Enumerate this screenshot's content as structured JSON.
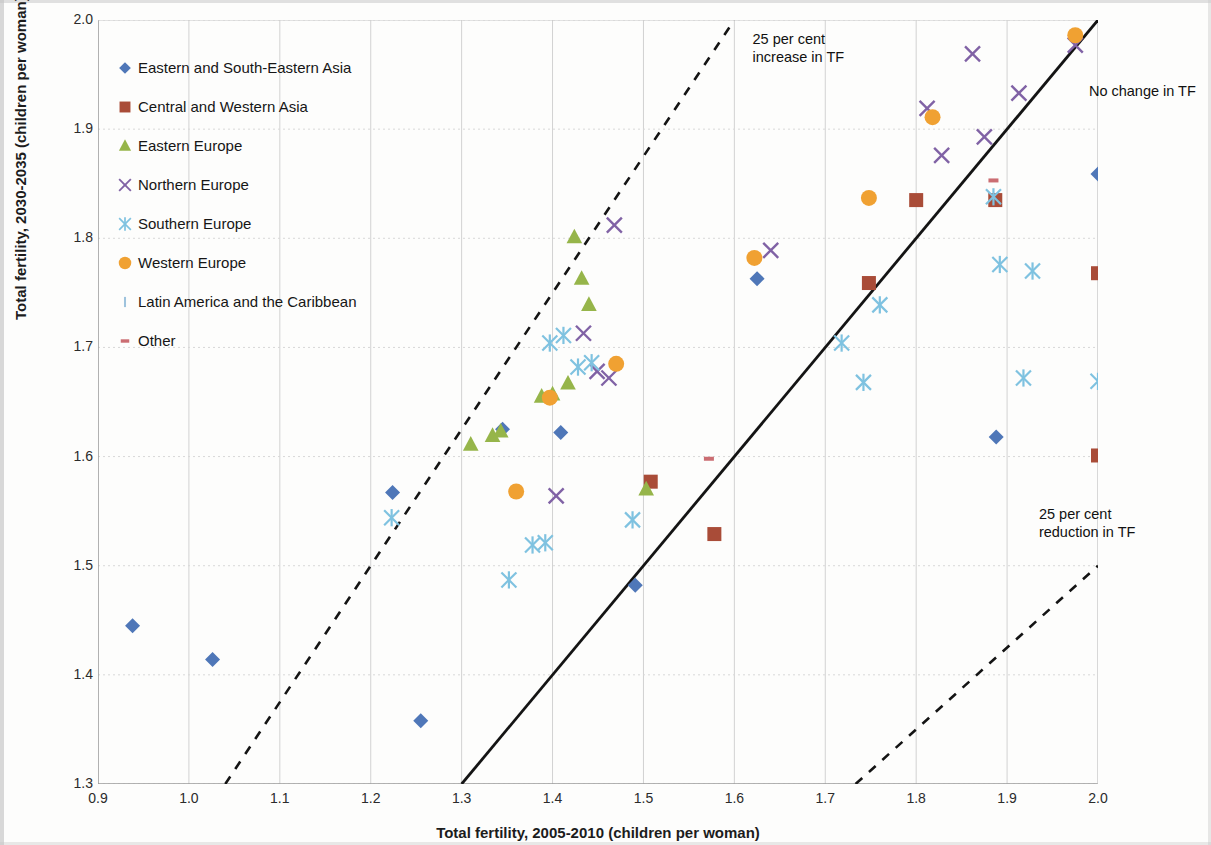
{
  "chart_data": {
    "type": "scatter",
    "title": "",
    "xlabel": "Total fertility, 2005-2010 (children per woman)",
    "ylabel": "Total fertility, 2030-2035 (children per woman)",
    "xlim": [
      0.9,
      2.0
    ],
    "ylim": [
      1.3,
      2.0
    ],
    "xticks": [
      "0.9",
      "1.0",
      "1.1",
      "1.2",
      "1.3",
      "1.4",
      "1.5",
      "1.6",
      "1.7",
      "1.8",
      "1.9",
      "2.0"
    ],
    "yticks": [
      "1.3",
      "1.4",
      "1.5",
      "1.6",
      "1.7",
      "1.8",
      "1.9",
      "2.0"
    ],
    "grid": true,
    "legend_position": "upper-left-inside",
    "reference_lines": [
      {
        "name": "no-change",
        "label": "No change in TF",
        "style": "solid",
        "slope": 1.0,
        "intercept": 0.0
      },
      {
        "name": "increase-25",
        "label": "25 per cent increase in TF",
        "style": "dashed",
        "slope": 1.25,
        "intercept": 0.0
      },
      {
        "name": "reduction-25",
        "label": "25 per cent reduction in TF",
        "style": "dashed",
        "slope": 0.75,
        "intercept": 0.0
      }
    ],
    "series": [
      {
        "name": "Eastern and South-Eastern Asia",
        "marker": "diamond",
        "color": "#4f77b8",
        "points": [
          [
            0.938,
            1.445
          ],
          [
            1.026,
            1.414
          ],
          [
            1.224,
            1.567
          ],
          [
            1.255,
            1.358
          ],
          [
            1.345,
            1.625
          ],
          [
            1.409,
            1.622
          ],
          [
            1.491,
            1.482
          ],
          [
            1.625,
            1.763
          ],
          [
            1.888,
            1.618
          ],
          [
            2.0,
            1.859
          ]
        ]
      },
      {
        "name": "Central and Western Asia",
        "marker": "square",
        "color": "#a94c38",
        "points": [
          [
            1.508,
            1.577
          ],
          [
            1.578,
            1.529
          ],
          [
            1.748,
            1.759
          ],
          [
            1.8,
            1.835
          ],
          [
            1.887,
            1.835
          ],
          [
            2.0,
            1.768
          ],
          [
            2.0,
            1.601
          ]
        ]
      },
      {
        "name": "Eastern Europe",
        "marker": "triangle",
        "color": "#96b54a",
        "points": [
          [
            1.31,
            1.611
          ],
          [
            1.334,
            1.619
          ],
          [
            1.343,
            1.623
          ],
          [
            1.388,
            1.655
          ],
          [
            1.4,
            1.657
          ],
          [
            1.417,
            1.667
          ],
          [
            1.424,
            1.801
          ],
          [
            1.432,
            1.763
          ],
          [
            1.44,
            1.739
          ],
          [
            1.503,
            1.57
          ]
        ]
      },
      {
        "name": "Northern Europe",
        "marker": "x",
        "color": "#8062a5",
        "points": [
          [
            1.404,
            1.564
          ],
          [
            1.434,
            1.713
          ],
          [
            1.449,
            1.678
          ],
          [
            1.462,
            1.672
          ],
          [
            1.468,
            1.812
          ],
          [
            1.64,
            1.789
          ],
          [
            1.812,
            1.919
          ],
          [
            1.828,
            1.876
          ],
          [
            1.862,
            1.969
          ],
          [
            1.875,
            1.893
          ],
          [
            1.913,
            1.933
          ],
          [
            1.975,
            1.977
          ]
        ]
      },
      {
        "name": "Southern Europe",
        "marker": "asterisk",
        "color": "#7fc2e0",
        "points": [
          [
            1.223,
            1.544
          ],
          [
            1.352,
            1.487
          ],
          [
            1.378,
            1.519
          ],
          [
            1.392,
            1.521
          ],
          [
            1.397,
            1.704
          ],
          [
            1.412,
            1.711
          ],
          [
            1.428,
            1.682
          ],
          [
            1.443,
            1.686
          ],
          [
            1.488,
            1.542
          ],
          [
            1.742,
            1.668
          ],
          [
            1.76,
            1.739
          ],
          [
            1.718,
            1.704
          ],
          [
            1.885,
            1.838
          ],
          [
            1.892,
            1.776
          ],
          [
            1.918,
            1.672
          ],
          [
            1.928,
            1.77
          ],
          [
            2.0,
            1.669
          ]
        ]
      },
      {
        "name": "Western Europe",
        "marker": "circle",
        "color": "#f0a132",
        "points": [
          [
            1.36,
            1.568
          ],
          [
            1.397,
            1.654
          ],
          [
            1.47,
            1.685
          ],
          [
            1.622,
            1.782
          ],
          [
            1.748,
            1.837
          ],
          [
            1.818,
            1.911
          ],
          [
            1.975,
            1.986
          ]
        ]
      },
      {
        "name": "Latin America and the Caribbean",
        "marker": "bar-tiny",
        "color": "#9ec3dd",
        "points": []
      },
      {
        "name": "Other",
        "marker": "dash",
        "color": "#cb6d72",
        "points": [
          [
            1.572,
            1.598
          ],
          [
            1.885,
            1.853
          ]
        ]
      }
    ]
  },
  "annotations": {
    "increase": {
      "line1": "25 per cent",
      "line2": "increase in TF"
    },
    "nochange": {
      "line1": "No change in TF"
    },
    "reduction": {
      "line1": "25 per cent",
      "line2": "reduction in TF"
    }
  }
}
